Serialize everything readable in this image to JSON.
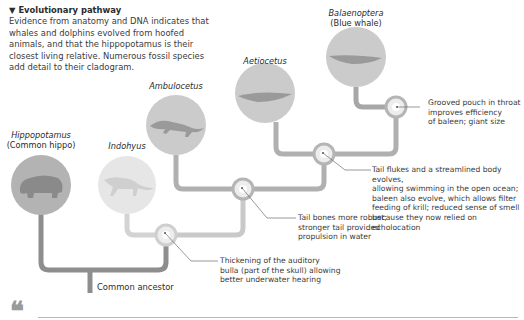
{
  "intro": {
    "title_marker": "▼",
    "title": "Evolutionary pathway",
    "body": "Evidence from anatomy and DNA indicates that whales and dolphins evolved from hoofed animals, and that the hippopotamus is their closest living relative. Numerous fossil species add detail to their cladogram."
  },
  "taxa": [
    {
      "name": "Hippopotamus",
      "common": "(Common hippo)",
      "icon": "hippo-icon",
      "color": "#b3b3b3"
    },
    {
      "name": "Indohyus",
      "common": "",
      "icon": "indohyus-icon",
      "color": "#e6e6e6"
    },
    {
      "name": "Ambulocetus",
      "common": "",
      "icon": "ambulocetus-icon",
      "color": "#cbcbcb"
    },
    {
      "name": "Aetiocetus",
      "common": "",
      "icon": "aetiocetus-icon",
      "color": "#cbcbcb"
    },
    {
      "name": "Balaenoptera",
      "common": "(Blue whale)",
      "icon": "blue-whale-icon",
      "color": "#cbcbcb"
    }
  ],
  "notes": [
    "Thickening of the auditory bulla (part of the skull) allowing better underwater hearing",
    "Tail bones more robust; stronger tail provided propulsion in water",
    "Tail flukes and a streamlined body evolves, allowing swimming in the open ocean; baleen also evolve, which allows filter feeding of krill; reduced sense of smell because they now relied on echolocation",
    "Grooved pouch in throat improves efficiency of baleen; giant size"
  ],
  "notes_lines": [
    [
      "Thickening of the auditory",
      "bulla (part of the skull) allowing",
      "better underwater hearing"
    ],
    [
      "Tail bones more robust;",
      "stronger tail provided",
      "propulsion in water"
    ],
    [
      "Tail flukes and a streamlined body evolves,",
      "allowing swimming in the open ocean;",
      "baleen also evolve, which allows filter",
      "feeding of krill; reduced sense of smell",
      "because they now relied on echolocation"
    ],
    [
      "Grooved pouch in throat",
      "improves efficiency",
      "of baleen; giant size"
    ]
  ],
  "root_label": "Common ancestor",
  "quote_mark": "❝",
  "colors": {
    "branch_dark": "#8e8e8e",
    "branch_mid": "#a9a9a9",
    "branch_light": "#c9c9c9",
    "node_ring": "#c4c4c4",
    "animal": "#8c8c8c"
  }
}
